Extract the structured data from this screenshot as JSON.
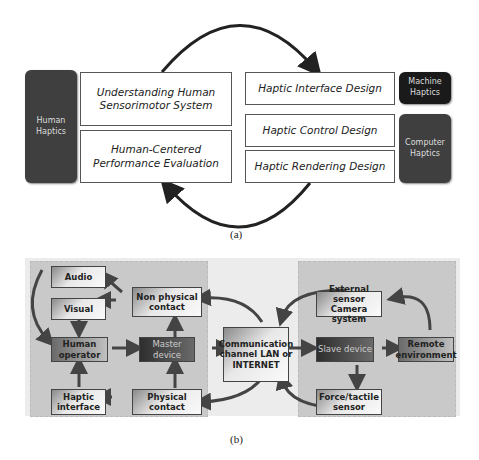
{
  "figure_a": {
    "caption": "(a)",
    "left_label": "Human\nHaptics",
    "boxes_left": [
      "Understanding Human Sensorimotor System",
      "Human-Centered Performance Evaluation"
    ],
    "boxes_right": [
      "Haptic Interface Design",
      "Haptic Control Design",
      "Haptic Rendering Design"
    ],
    "right_labels": [
      "Machine\nHaptics",
      "Computer\nHaptics"
    ]
  },
  "figure_b": {
    "caption": "(b)",
    "nodes": {
      "audio": "Audio",
      "visual": "Visual",
      "non_physical": "Non physical contact",
      "human_operator": "Human operator",
      "master_device": "Master device",
      "haptic_interface": "Haptic interface",
      "physical_contact": "Physical contact",
      "comm_channel": "Communication channel LAN or INTERNET",
      "external_sensor": "External sensor Camera system",
      "slave_device": "Slave device",
      "remote_env": "Remote environment",
      "force_sensor": "Force/tactile sensor"
    }
  }
}
